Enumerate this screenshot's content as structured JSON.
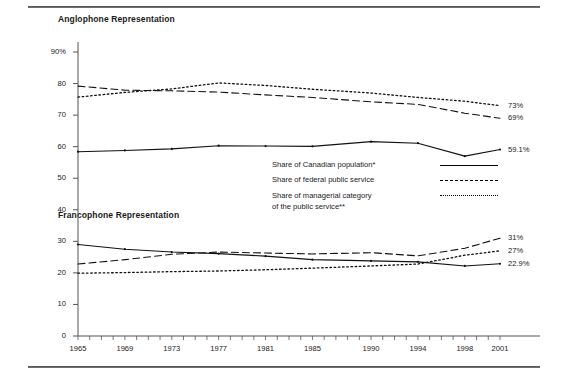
{
  "figure": {
    "sections": {
      "anglophone_title": "Anglophone Representation",
      "francophone_title": "Francophone Representation"
    },
    "legend": {
      "items": [
        {
          "label": "Share of Canadian population*",
          "style": "solid"
        },
        {
          "label": "Share of federal public service",
          "style": "dashed"
        },
        {
          "label": "Share of managerial category",
          "label2": "of the public service**",
          "style": "dotted"
        }
      ]
    },
    "end_labels": {
      "anglophone": [
        {
          "value": "73%",
          "series": "managerial-category"
        },
        {
          "value": "69%",
          "series": "federal-public-service"
        },
        {
          "value": "59.1%",
          "series": "canadian-population"
        }
      ],
      "francophone": [
        {
          "value": "31%",
          "series": "federal-public-service"
        },
        {
          "value": "27%",
          "series": "managerial-category"
        },
        {
          "value": "22.9%",
          "series": "canadian-population"
        }
      ]
    },
    "axis": {
      "y_ticks": [
        "90%",
        "80",
        "70",
        "60",
        "50",
        "40",
        "30",
        "20",
        "10",
        "0"
      ],
      "x_ticks": [
        "1965",
        "1969",
        "1973",
        "1977",
        "1981",
        "1985",
        "1990",
        "1994",
        "1998",
        "2001"
      ]
    }
  },
  "chart_data": {
    "type": "line",
    "title": "",
    "xlabel": "",
    "ylabel": "",
    "ylim": [
      0,
      90
    ],
    "xlim": [
      1965,
      2001
    ],
    "grid": false,
    "legend_position": "center-right",
    "ytick_labels": [
      "0",
      "10",
      "20",
      "30",
      "40",
      "50",
      "60",
      "70",
      "80",
      "90%"
    ],
    "ytick_values": [
      0,
      10,
      20,
      30,
      40,
      50,
      60,
      70,
      80,
      90
    ],
    "xtick_labels": [
      "1965",
      "1969",
      "1973",
      "1977",
      "1981",
      "1985",
      "1990",
      "1994",
      "1998",
      "2001"
    ],
    "xtick_values": [
      1965,
      1969,
      1973,
      1977,
      1981,
      1985,
      1990,
      1994,
      1998,
      2001
    ],
    "annotations": [
      "Anglophone Representation",
      "Francophone Representation"
    ],
    "groups": [
      {
        "name": "Anglophone Representation",
        "series": [
          {
            "name": "Share of Canadian population*",
            "style": "solid",
            "x": [
              1965,
              1969,
              1973,
              1977,
              1981,
              1985,
              1990,
              1994,
              1998,
              2001
            ],
            "y": [
              58.4,
              58.8,
              59.3,
              60.3,
              60.2,
              60.1,
              61.6,
              61.1,
              57.0,
              59.1
            ],
            "end_label": "59.1%"
          },
          {
            "name": "Share of federal public service",
            "style": "dashed",
            "x": [
              1965,
              1969,
              1973,
              1977,
              1981,
              1985,
              1990,
              1994,
              1998,
              2001
            ],
            "y": [
              79.2,
              77.9,
              77.7,
              77.3,
              76.4,
              75.6,
              74.2,
              73.4,
              70.6,
              69.0
            ],
            "end_label": "69%"
          },
          {
            "name": "Share of managerial category of the public service**",
            "style": "dotted",
            "x": [
              1965,
              1969,
              1973,
              1977,
              1981,
              1985,
              1990,
              1994,
              1998,
              2001
            ],
            "y": [
              75.7,
              77.2,
              78.3,
              80.2,
              79.4,
              78.2,
              77.0,
              75.6,
              74.4,
              73.0
            ],
            "end_label": "73%"
          }
        ]
      },
      {
        "name": "Francophone Representation",
        "series": [
          {
            "name": "Share of Canadian population*",
            "style": "solid",
            "x": [
              1965,
              1969,
              1973,
              1977,
              1981,
              1985,
              1990,
              1994,
              1998,
              2001
            ],
            "y": [
              29.0,
              27.5,
              26.6,
              26.1,
              25.3,
              24.2,
              23.8,
              23.5,
              22.2,
              22.9
            ],
            "end_label": "22.9%"
          },
          {
            "name": "Share of federal public service",
            "style": "dashed",
            "x": [
              1965,
              1969,
              1973,
              1977,
              1981,
              1985,
              1990,
              1994,
              1998,
              2001
            ],
            "y": [
              22.8,
              24.2,
              25.9,
              26.6,
              26.3,
              26.0,
              26.4,
              25.4,
              27.8,
              31.0
            ],
            "end_label": "31%"
          },
          {
            "name": "Share of managerial category of the public service**",
            "style": "dotted",
            "x": [
              1965,
              1969,
              1973,
              1977,
              1981,
              1985,
              1990,
              1994,
              1998,
              2001
            ],
            "y": [
              19.9,
              20.1,
              20.4,
              20.6,
              21.0,
              21.5,
              22.2,
              22.8,
              25.6,
              27.0
            ],
            "end_label": "27%"
          }
        ]
      }
    ]
  }
}
